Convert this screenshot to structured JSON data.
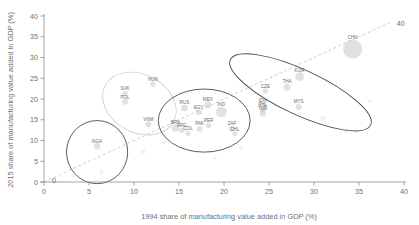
{
  "chart_data": {
    "type": "scatter",
    "title": "",
    "xlabel": "1994 share of manufacturing value added in GDP (%)",
    "ylabel": "2015 share of manufacturing value added in GDP (%)",
    "xlim": [
      0,
      40
    ],
    "ylim": [
      0,
      40
    ],
    "xticks": [
      0,
      5,
      10,
      15,
      20,
      25,
      30,
      35,
      40
    ],
    "yticks": [
      0,
      5,
      10,
      15,
      20,
      25,
      30,
      35,
      40
    ],
    "grid": false,
    "legend": "none",
    "annotations": [
      {
        "name": "diagonal-origin-label",
        "text": "0",
        "x": 0,
        "y": 0
      },
      {
        "name": "diagonal-end-label",
        "text": "40",
        "x": 40,
        "y": 40
      },
      {
        "name": "diagonal-reference-line",
        "text": "45-degree line",
        "from": [
          0,
          0
        ],
        "to": [
          40,
          40
        ]
      }
    ],
    "points": [
      {
        "label": "NGA",
        "x": 5.9,
        "y": 8.6,
        "size": 3.2
      },
      {
        "label": "SVK",
        "x": 9.0,
        "y": 21.3,
        "size": 2.6
      },
      {
        "label": "POL",
        "x": 9.0,
        "y": 19.3,
        "size": 2.8
      },
      {
        "label": "HUN",
        "x": 12.1,
        "y": 23.6,
        "size": 2.6
      },
      {
        "label": "VNM",
        "x": 11.6,
        "y": 13.9,
        "size": 3.0
      },
      {
        "label": "MEX",
        "x": 18.2,
        "y": 18.6,
        "size": 3.6
      },
      {
        "label": "EGY",
        "x": 17.2,
        "y": 16.8,
        "size": 3.0
      },
      {
        "label": "IND",
        "x": 19.7,
        "y": 16.9,
        "size": 5.4
      },
      {
        "label": "RUS",
        "x": 15.6,
        "y": 17.8,
        "size": 3.4
      },
      {
        "label": "BRA",
        "x": 14.6,
        "y": 13.0,
        "size": 3.8
      },
      {
        "label": "ARG",
        "x": 15.3,
        "y": 12.4,
        "size": 2.8
      },
      {
        "label": "COL",
        "x": 16.0,
        "y": 11.7,
        "size": 2.6
      },
      {
        "label": "PAK",
        "x": 17.3,
        "y": 12.8,
        "size": 2.8
      },
      {
        "label": "PER",
        "x": 18.3,
        "y": 13.6,
        "size": 2.6
      },
      {
        "label": "ZAF",
        "x": 20.9,
        "y": 12.9,
        "size": 2.8
      },
      {
        "label": "CHL",
        "x": 21.2,
        "y": 11.6,
        "size": 2.6
      },
      {
        "label": "CZE",
        "x": 24.6,
        "y": 21.9,
        "size": 2.6
      },
      {
        "label": "THA",
        "x": 27.0,
        "y": 22.8,
        "size": 3.4
      },
      {
        "label": "KOR",
        "x": 28.4,
        "y": 25.4,
        "size": 4.4
      },
      {
        "label": "MYS",
        "x": 28.3,
        "y": 18.1,
        "size": 3.0
      },
      {
        "label": "IDN",
        "x": 24.3,
        "y": 18.3,
        "size": 3.0
      },
      {
        "label": "PHL",
        "x": 24.3,
        "y": 17.4,
        "size": 2.8
      },
      {
        "label": "TUR",
        "x": 24.3,
        "y": 16.5,
        "size": 3.2
      },
      {
        "label": "CHN",
        "x": 34.3,
        "y": 32.0,
        "size": 9.5
      }
    ],
    "groups": [
      {
        "name": "low-share-group",
        "style": "dark",
        "cx": 5.9,
        "cy": 7.2,
        "rx": 3.4,
        "ry": 7.6,
        "rotate": 0
      },
      {
        "name": "emerging-europe-group",
        "style": "light",
        "cx": 10.6,
        "cy": 18.9,
        "rx": 4.3,
        "ry": 7.0,
        "rotate": 28
      },
      {
        "name": "middle-income-group",
        "style": "dark",
        "cx": 17.8,
        "cy": 14.8,
        "rx": 5.1,
        "ry": 7.6,
        "rotate": 0
      },
      {
        "name": "industrialised-asia-group",
        "style": "dark",
        "cx": 28.5,
        "cy": 21.6,
        "rx": 8.6,
        "ry": 5.4,
        "rotate": 25
      }
    ],
    "background_points": [
      {
        "x": 31.0,
        "y": 15.3,
        "size": 2.6
      },
      {
        "x": 33.6,
        "y": 12.4,
        "size": 2.2
      },
      {
        "x": 22.4,
        "y": 23.4,
        "size": 2.0
      },
      {
        "x": 13.4,
        "y": 9.6,
        "size": 2.0
      },
      {
        "x": 8.2,
        "y": 12.2,
        "size": 1.8
      },
      {
        "x": 11.0,
        "y": 7.4,
        "size": 2.2
      },
      {
        "x": 21.9,
        "y": 8.3,
        "size": 2.0
      },
      {
        "x": 19.0,
        "y": 5.8,
        "size": 1.8
      },
      {
        "x": 36.2,
        "y": 19.5,
        "size": 1.8
      },
      {
        "x": 6.4,
        "y": 2.4,
        "size": 2.0
      },
      {
        "x": 3.2,
        "y": 1.5,
        "size": 1.8
      }
    ]
  }
}
